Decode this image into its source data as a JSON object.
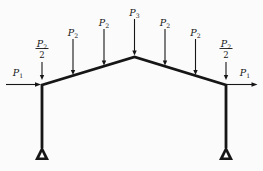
{
  "figure": {
    "kind": "gable-frame-load-diagram",
    "background": "#fbfbfb",
    "ink": "#161616",
    "frame": {
      "stroke_width": 2.8,
      "nodes": {
        "left_base": [
          42,
          148
        ],
        "left_eave": [
          42,
          85
        ],
        "apex": [
          134.5,
          57
        ],
        "right_eave": [
          226,
          85
        ],
        "right_base": [
          226,
          148
        ]
      }
    },
    "supports": [
      {
        "name": "left-pin-support",
        "x": 42,
        "apex_y": 146,
        "base_y": 160,
        "half_width": 7
      },
      {
        "name": "right-pin-support",
        "x": 226,
        "apex_y": 146,
        "base_y": 160,
        "half_width": 7
      }
    ],
    "vertical_loads": [
      {
        "name": "load-p2-half-left",
        "base": "P",
        "sub": "2",
        "den": "2",
        "x": 42,
        "tail_y": 62,
        "tip_y": 80,
        "label_y": 48.5
      },
      {
        "name": "load-p2-1",
        "base": "P",
        "sub": "2",
        "x": 73,
        "tail_y": 39,
        "tip_y": 75,
        "label_y": 36
      },
      {
        "name": "load-p2-2",
        "base": "P",
        "sub": "2",
        "x": 104,
        "tail_y": 29,
        "tip_y": 65.5,
        "label_y": 26
      },
      {
        "name": "load-p3-apex",
        "base": "P",
        "sub": "3",
        "x": 134.5,
        "tail_y": 19,
        "tip_y": 55.5,
        "label_y": 16
      },
      {
        "name": "load-p2-3",
        "base": "P",
        "sub": "2",
        "x": 165,
        "tail_y": 29,
        "tip_y": 65.5,
        "label_y": 26
      },
      {
        "name": "load-p2-4",
        "base": "P",
        "sub": "2",
        "x": 195.5,
        "tail_y": 39,
        "tip_y": 75,
        "label_y": 36
      },
      {
        "name": "load-p2-half-right",
        "base": "P",
        "sub": "2",
        "den": "2",
        "x": 226,
        "tail_y": 62,
        "tip_y": 80,
        "label_y": 48.5
      }
    ],
    "horizontal_loads": [
      {
        "name": "load-p1-left",
        "base": "P",
        "sub": "1",
        "y": 84.5,
        "tail_x": 6,
        "tip_x": 41,
        "label_x": 18,
        "label_y": 75.5
      },
      {
        "name": "load-p1-right",
        "base": "P",
        "sub": "1",
        "y": 84.5,
        "tail_x": 227,
        "tip_x": 257.5,
        "label_x": 245,
        "label_y": 75.5
      }
    ]
  }
}
